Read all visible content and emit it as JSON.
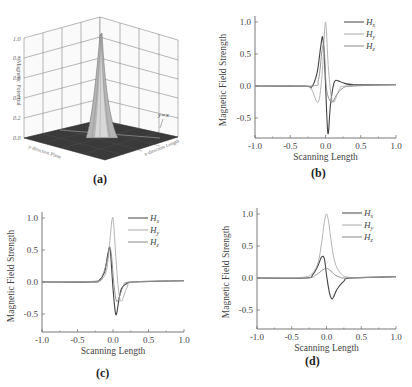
{
  "figure": {
    "panels": [
      "(a)",
      "(b)",
      "(c)",
      "(d)"
    ]
  },
  "chart_data": [
    {
      "id": "a",
      "type": "surface3d",
      "label": "(a)",
      "zlabel": "Magnetic Potential",
      "xlabel": "y-direction Plane",
      "ylabel": "x-direction Length",
      "z_ticks": [
        "0.0",
        "0.2",
        "0.4",
        "0.6",
        "0.8",
        "1.0"
      ],
      "annotation": "y=x",
      "zlim": [
        0,
        1.0
      ],
      "peak": {
        "x": 0,
        "y": 0,
        "z": 1.0
      }
    },
    {
      "id": "b",
      "type": "line",
      "label": "(b)",
      "xlabel": "Scanning Length",
      "ylabel": "Magnetic Field Strength",
      "x_ticks": [
        "-1.0",
        "-0.5",
        "0.0",
        "0.5",
        "1.0"
      ],
      "y_ticks": [
        "1.0",
        "0.5",
        "0.0",
        "-0.5"
      ],
      "xlim": [
        -1.0,
        1.0
      ],
      "ylim": [
        -0.8,
        1.05
      ],
      "legend": [
        "Hx",
        "Hy",
        "Hz"
      ],
      "legend_sub": [
        "x",
        "y",
        "z"
      ],
      "series": [
        {
          "name": "Hx",
          "color": "#444444",
          "x": [
            -1.0,
            -0.3,
            -0.2,
            -0.12,
            -0.07,
            -0.04,
            -0.01,
            0.02,
            0.04,
            0.07,
            0.12,
            0.18,
            0.25,
            0.4,
            1.0
          ],
          "y": [
            0.0,
            0.0,
            -0.02,
            0.2,
            0.6,
            0.76,
            0.3,
            -0.5,
            -0.74,
            -0.3,
            0.05,
            0.08,
            0.05,
            0.02,
            0.02
          ]
        },
        {
          "name": "Hy",
          "color": "#aaaaaa",
          "x": [
            -1.0,
            -0.3,
            -0.2,
            -0.12,
            -0.08,
            -0.04,
            0.0,
            0.04,
            0.08,
            0.12,
            0.2,
            0.3,
            1.0
          ],
          "y": [
            0.0,
            0.0,
            -0.05,
            -0.25,
            -0.15,
            0.3,
            1.0,
            0.3,
            -0.15,
            -0.25,
            -0.05,
            0.0,
            0.02
          ]
        },
        {
          "name": "Hz",
          "color": "#888888",
          "x": [
            -1.0,
            -0.2,
            -0.1,
            -0.05,
            -0.02,
            0.01,
            0.05,
            0.1,
            0.15,
            0.25,
            0.4,
            1.0
          ],
          "y": [
            0.0,
            0.0,
            0.1,
            0.55,
            0.6,
            0.0,
            -0.2,
            -0.25,
            -0.15,
            -0.03,
            0.0,
            0.02
          ]
        }
      ]
    },
    {
      "id": "c",
      "type": "line",
      "label": "(c)",
      "xlabel": "Scanning Length",
      "ylabel": "Magnetic Field Strength",
      "x_ticks": [
        "-1.0",
        "-0.5",
        "0.0",
        "0.5",
        "1.0"
      ],
      "y_ticks": [
        "1.0",
        "0.5",
        "0.0",
        "-0.5"
      ],
      "xlim": [
        -1.0,
        1.0
      ],
      "ylim": [
        -0.8,
        1.05
      ],
      "legend": [
        "Hx",
        "Hy",
        "Hz"
      ],
      "legend_sub": [
        "x",
        "y",
        "z"
      ],
      "series": [
        {
          "name": "Hx",
          "color": "#444444",
          "x": [
            -1.0,
            -0.3,
            -0.2,
            -0.12,
            -0.07,
            -0.04,
            0.0,
            0.03,
            0.05,
            0.08,
            0.12,
            0.2,
            0.3,
            1.0
          ],
          "y": [
            0.0,
            0.0,
            0.02,
            0.15,
            0.45,
            0.5,
            -0.1,
            -0.45,
            -0.5,
            -0.3,
            -0.1,
            -0.02,
            0.0,
            0.02
          ]
        },
        {
          "name": "Hy",
          "color": "#aaaaaa",
          "x": [
            -1.0,
            -0.3,
            -0.15,
            -0.08,
            -0.04,
            -0.01,
            0.01,
            0.04,
            0.08,
            0.12,
            0.2,
            0.3,
            1.0
          ],
          "y": [
            0.0,
            0.01,
            0.05,
            0.25,
            0.7,
            1.0,
            0.9,
            0.4,
            -0.15,
            -0.3,
            -0.08,
            0.0,
            0.02
          ]
        },
        {
          "name": "Hz",
          "color": "#888888",
          "x": [
            -1.0,
            -0.25,
            -0.15,
            -0.08,
            -0.05,
            -0.02,
            0.01,
            0.05,
            0.1,
            0.15,
            0.25,
            1.0
          ],
          "y": [
            0.0,
            0.01,
            0.1,
            0.35,
            0.55,
            0.4,
            0.0,
            -0.3,
            -0.2,
            -0.06,
            0.0,
            0.02
          ]
        }
      ]
    },
    {
      "id": "d",
      "type": "line",
      "label": "(d)",
      "xlabel": "Scanning Length",
      "ylabel": "Magnetic Field Strength",
      "x_ticks": [
        "-1.0",
        "-0.5",
        "0.0",
        "0.5",
        "1.0"
      ],
      "y_ticks": [
        "1.0",
        "0.5",
        "0.0",
        "-0.5"
      ],
      "xlim": [
        -1.0,
        1.0
      ],
      "ylim": [
        -0.8,
        1.05
      ],
      "legend": [
        "Hx",
        "Hy",
        "Hz"
      ],
      "legend_sub": [
        "x",
        "y",
        "z"
      ],
      "series": [
        {
          "name": "Hx",
          "color": "#444444",
          "x": [
            -1.0,
            -0.3,
            -0.2,
            -0.12,
            -0.07,
            -0.03,
            0.0,
            0.04,
            0.07,
            0.1,
            0.15,
            0.25,
            0.35,
            1.0
          ],
          "y": [
            0.0,
            0.0,
            0.05,
            0.2,
            0.33,
            0.3,
            0.05,
            -0.22,
            -0.32,
            -0.3,
            -0.18,
            -0.05,
            0.0,
            0.02
          ]
        },
        {
          "name": "Hy",
          "color": "#aaaaaa",
          "x": [
            -1.0,
            -0.35,
            -0.2,
            -0.12,
            -0.07,
            -0.03,
            0.0,
            0.03,
            0.07,
            0.12,
            0.2,
            0.35,
            1.0
          ],
          "y": [
            0.0,
            0.01,
            0.08,
            0.25,
            0.55,
            0.88,
            1.0,
            0.88,
            0.55,
            0.25,
            0.08,
            0.01,
            0.02
          ]
        },
        {
          "name": "Hz",
          "color": "#888888",
          "x": [
            -1.0,
            -0.3,
            -0.15,
            -0.05,
            0.0,
            0.05,
            0.12,
            0.2,
            0.3,
            1.0
          ],
          "y": [
            0.0,
            0.0,
            0.05,
            0.13,
            0.15,
            0.12,
            0.05,
            0.01,
            0.0,
            0.02
          ]
        }
      ]
    }
  ]
}
